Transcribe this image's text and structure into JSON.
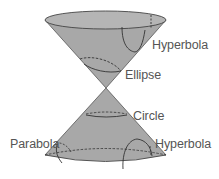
{
  "diagram": {
    "colors": {
      "cone_fill": "#a8a8a8",
      "top_fill": "#b3b3b3",
      "stroke": "#3c3c3c",
      "label": "#555555"
    },
    "labels": {
      "hyperbola_top": "Hyperbola",
      "ellipse": "Ellipse",
      "circle": "Circle",
      "parabola": "Parabola",
      "hyperbola_bottom": "Hyperbola"
    }
  }
}
